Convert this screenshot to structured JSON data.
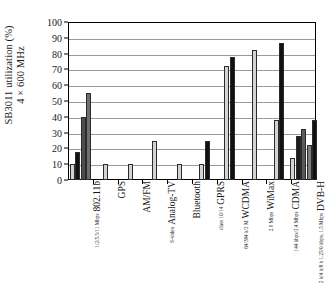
{
  "chart_data": {
    "type": "bar",
    "title": "",
    "xlabel": "",
    "ylabel": "SB3011 utilization (%)  4 × 600 MHz",
    "ylabel_line1": "SB3011 utilization (%)",
    "ylabel_line2": "4 × 600 MHz",
    "ylim": [
      0,
      100
    ],
    "yticks": [
      0,
      10,
      20,
      30,
      40,
      50,
      60,
      70,
      80,
      90,
      100
    ],
    "ytick_labels": [
      "0",
      "10",
      "20",
      "30",
      "40",
      "50",
      "60",
      "70",
      "80",
      "90",
      "100"
    ],
    "grid": true,
    "legend": "none",
    "categories": [
      {
        "label": "802.11b",
        "sublabel": "1/2/5.5/11 Mbps"
      },
      {
        "label": "GPS",
        "sublabel": ""
      },
      {
        "label": "AM/FM",
        "sublabel": ""
      },
      {
        "label": "Analog-TV",
        "sublabel": "S-video"
      },
      {
        "label": "Bluetooth",
        "sublabel": ""
      },
      {
        "label": "GPRS",
        "sublabel": "class 10/14"
      },
      {
        "label": "WCDMA",
        "sublabel": "64/384 k/2 M"
      },
      {
        "label": "WiMax",
        "sublabel": "2.9 Mbps"
      },
      {
        "label": "CDMA",
        "sublabel": "144 kbps/2.4 Mbps"
      },
      {
        "label": "DVB-H",
        "sublabel": "2 k/4 k/8 k 1.25/0 kbps, 1.5 Mbps"
      }
    ],
    "group_values": [
      [
        10,
        18,
        40,
        55
      ],
      [
        10
      ],
      [
        10
      ],
      [
        25
      ],
      [
        10
      ],
      [
        10,
        25
      ],
      [
        72,
        78
      ],
      [
        82
      ],
      [
        38,
        87
      ],
      [
        14,
        28,
        32,
        22,
        38
      ]
    ],
    "group_colors": [
      [
        "#d3d3d3",
        "#111111",
        "#4d4d4d",
        "#6e6e6e"
      ],
      [
        "#d3d3d3"
      ],
      [
        "#d3d3d3"
      ],
      [
        "#d3d3d3"
      ],
      [
        "#d3d3d3"
      ],
      [
        "#d3d3d3",
        "#111111"
      ],
      [
        "#d3d3d3",
        "#111111"
      ],
      [
        "#d3d3d3"
      ],
      [
        "#d3d3d3",
        "#111111"
      ],
      [
        "#d3d3d3",
        "#1c1c1c",
        "#5a5a5a",
        "#7d7d7d",
        "#111111"
      ]
    ]
  },
  "colors": {
    "axis": "#000000",
    "grid": "#9a9a9a",
    "background": "#ffffff",
    "bar_light": "#d3d3d3",
    "bar_black": "#111111",
    "bar_dark_gray": "#4d4d4d",
    "bar_mid_gray": "#6e6e6e"
  }
}
